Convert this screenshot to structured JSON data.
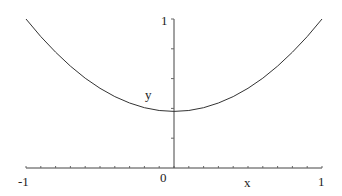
{
  "chart_data": {
    "type": "line",
    "title": "",
    "xlabel": "x",
    "ylabel": "y",
    "xlim": [
      -1,
      1
    ],
    "ylim": [
      0,
      1
    ],
    "x_ticks": [
      "-1",
      "0",
      "1"
    ],
    "y_ticks": [
      "1"
    ],
    "grid": false,
    "legend": null,
    "series": [
      {
        "name": "y",
        "color": "#333333",
        "x": [
          -1,
          -0.9,
          -0.8,
          -0.7,
          -0.6,
          -0.5,
          -0.4,
          -0.3,
          -0.2,
          -0.1,
          0,
          0.1,
          0.2,
          0.3,
          0.4,
          0.5,
          0.6,
          0.7,
          0.8,
          0.9,
          1
        ],
        "y": [
          1.0,
          0.882,
          0.777,
          0.684,
          0.603,
          0.535,
          0.479,
          0.436,
          0.405,
          0.386,
          0.38,
          0.386,
          0.405,
          0.436,
          0.479,
          0.535,
          0.603,
          0.684,
          0.777,
          0.882,
          1.0
        ]
      }
    ]
  },
  "labels": {
    "x_min": "-1",
    "x_zero": "0",
    "x_max": "1",
    "y_max": "1",
    "x_axis": "x",
    "y_axis": "y"
  }
}
